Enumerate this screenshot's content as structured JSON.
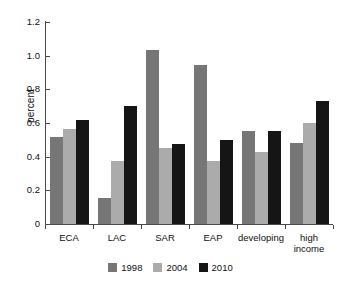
{
  "chart_data": {
    "type": "bar",
    "title": "",
    "xlabel": "",
    "ylabel": "percent",
    "ylim": [
      0,
      1.2
    ],
    "yticks": [
      "0",
      "0.2",
      "0.4",
      "0.6",
      "0.8",
      "1.0",
      "1.2"
    ],
    "grid": false,
    "legend_position": "bottom-center",
    "categories": [
      "ECA",
      "LAC",
      "SAR",
      "EAP",
      "developing",
      "high income"
    ],
    "category_label_lines": [
      [
        "ECA"
      ],
      [
        "LAC"
      ],
      [
        "SAR"
      ],
      [
        "EAP"
      ],
      [
        "developing"
      ],
      [
        "high",
        "income"
      ]
    ],
    "series": [
      {
        "name": "1998",
        "color": "#767676",
        "values": [
          0.515,
          0.155,
          1.035,
          0.945,
          0.55,
          0.48
        ]
      },
      {
        "name": "2004",
        "color": "#ababab",
        "values": [
          0.565,
          0.375,
          0.45,
          0.375,
          0.425,
          0.6
        ]
      },
      {
        "name": "2010",
        "color": "#151515",
        "values": [
          0.615,
          0.7,
          0.475,
          0.5,
          0.555,
          0.73
        ]
      }
    ]
  },
  "legend": {
    "items": [
      {
        "label": "1998"
      },
      {
        "label": "2004"
      },
      {
        "label": "2010"
      }
    ]
  },
  "axis": {
    "y_title": "percent",
    "y_zero": "0"
  }
}
